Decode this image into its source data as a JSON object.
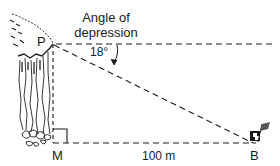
{
  "diagram": {
    "type": "angle-of-depression-trigonometry",
    "title_line1": "Angle of",
    "title_line2": "depression",
    "angle_label": "18°",
    "angle_degrees": 18,
    "point_top": "P",
    "point_base": "M",
    "point_target": "B",
    "distance_label": "100 m",
    "distance_value": 100,
    "distance_unit": "m",
    "line_color": "#1a1a1a"
  }
}
